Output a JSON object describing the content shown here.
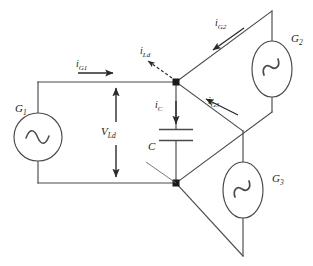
{
  "diagram": {
    "type": "electrical-circuit-schematic",
    "colors": {
      "background": "#ffffff",
      "wire": "#4a4a4a",
      "arrow": "#2b2b2b",
      "text": "#1a1a1a",
      "node": "#1a1a1a"
    },
    "sources": [
      {
        "name": "G1",
        "label_base": "G",
        "label_sub": "1",
        "symbol": "ac-source-sine",
        "shape": "circle"
      },
      {
        "name": "G2",
        "label_base": "G",
        "label_sub": "2",
        "symbol": "ac-source-sine",
        "shape": "ellipse"
      },
      {
        "name": "G3",
        "label_base": "G",
        "label_sub": "3",
        "symbol": "ac-source-sine",
        "shape": "ellipse"
      }
    ],
    "components": [
      {
        "name": "capacitor",
        "label_base": "C",
        "label_sub": "",
        "symbol": "capacitor-parallel-plates"
      }
    ],
    "currents": [
      {
        "name": "i_G1",
        "label_base": "i",
        "label_sub": "G1",
        "direction": "right",
        "style": "solid"
      },
      {
        "name": "i_G2",
        "label_base": "i",
        "label_sub": "G2",
        "direction": "down-left",
        "style": "solid"
      },
      {
        "name": "i_G3",
        "label_base": "i",
        "label_sub": "G3",
        "direction": "up-left",
        "style": "solid"
      },
      {
        "name": "i_Ld",
        "label_base": "i",
        "label_sub": "Ld",
        "direction": "up-left",
        "style": "dashed"
      },
      {
        "name": "i_C",
        "label_base": "i",
        "label_sub": "C",
        "direction": "down",
        "style": "solid"
      }
    ],
    "voltages": [
      {
        "name": "V_Ld",
        "label_base": "V",
        "label_sub": "Ld",
        "direction": "double-headed-vertical"
      }
    ]
  }
}
